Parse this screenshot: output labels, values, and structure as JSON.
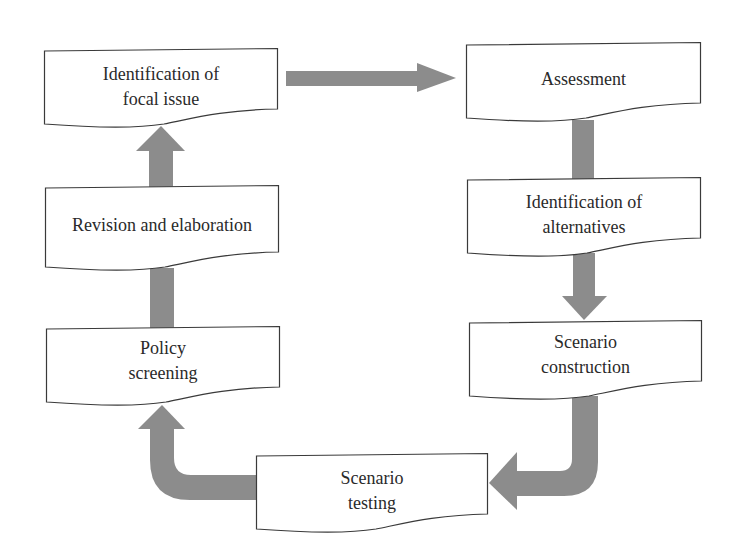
{
  "diagram": {
    "type": "cyclic-flowchart",
    "colors": {
      "arrow": "#8c8c8c",
      "box_border": "#3a3a3a",
      "box_fill": "#ffffff",
      "text": "#2a2a2a"
    },
    "nodes": [
      {
        "id": "focal_issue",
        "line1": "Identification of",
        "line2": "focal issue"
      },
      {
        "id": "assessment",
        "line1": "Assessment",
        "line2": ""
      },
      {
        "id": "alternatives",
        "line1": "Identification of",
        "line2": "alternatives"
      },
      {
        "id": "construction",
        "line1": "Scenario",
        "line2": "construction"
      },
      {
        "id": "testing",
        "line1": "Scenario",
        "line2": "testing"
      },
      {
        "id": "policy",
        "line1": "Policy",
        "line2": "screening"
      },
      {
        "id": "revision",
        "line1": "Revision and elaboration",
        "line2": ""
      }
    ],
    "edges": [
      {
        "from": "focal_issue",
        "to": "assessment"
      },
      {
        "from": "assessment",
        "to": "alternatives"
      },
      {
        "from": "alternatives",
        "to": "construction"
      },
      {
        "from": "construction",
        "to": "testing"
      },
      {
        "from": "testing",
        "to": "policy"
      },
      {
        "from": "policy",
        "to": "revision"
      },
      {
        "from": "revision",
        "to": "focal_issue"
      }
    ]
  }
}
